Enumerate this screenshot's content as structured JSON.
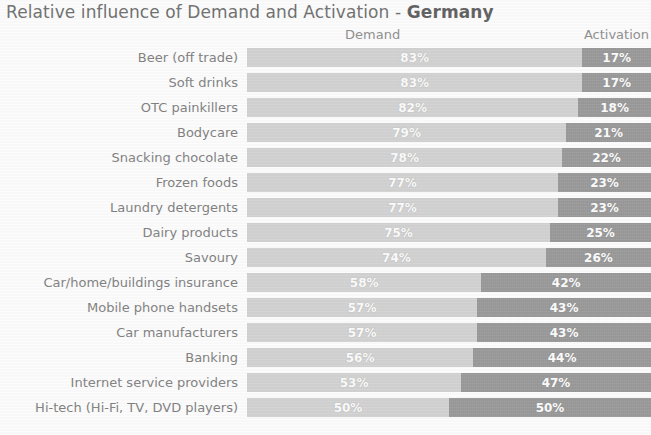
{
  "title": {
    "plain": "Relative influence of Demand and Activation - ",
    "bold": "Germany"
  },
  "headers": {
    "demand": "Demand",
    "activation": "Activation"
  },
  "colors": {
    "demand": "#d2d2d2",
    "activation": "#969696",
    "label_text": "#7b7b7b",
    "value_text": "#ffffff",
    "background": "#ffffff"
  },
  "chart_data": {
    "type": "bar",
    "title": "Relative influence of Demand and Activation - Germany",
    "xlabel": "",
    "ylabel": "",
    "xlim": [
      0,
      100
    ],
    "grid": false,
    "stacked": true,
    "orientation": "horizontal",
    "legend": [
      "Demand",
      "Activation"
    ],
    "legend_position": "top",
    "categories": [
      "Beer (off trade)",
      "Soft drinks",
      "OTC painkillers",
      "Bodycare",
      "Snacking chocolate",
      "Frozen foods",
      "Laundry detergents",
      "Dairy products",
      "Savoury",
      "Car/home/buildings insurance",
      "Mobile phone handsets",
      "Car manufacturers",
      "Banking",
      "Internet service providers",
      "Hi-tech (Hi-Fi, TV, DVD players)"
    ],
    "series": [
      {
        "name": "Demand",
        "values": [
          83,
          83,
          82,
          79,
          78,
          77,
          77,
          75,
          74,
          58,
          57,
          57,
          56,
          53,
          50
        ]
      },
      {
        "name": "Activation",
        "values": [
          17,
          17,
          18,
          21,
          22,
          23,
          23,
          25,
          26,
          42,
          43,
          43,
          44,
          47,
          50
        ]
      }
    ],
    "value_labels": {
      "demand": [
        "83%",
        "83%",
        "82%",
        "79%",
        "78%",
        "77%",
        "77%",
        "75%",
        "74%",
        "58%",
        "57%",
        "57%",
        "56%",
        "53%",
        "50%"
      ],
      "activation": [
        "17%",
        "17%",
        "18%",
        "21%",
        "22%",
        "23%",
        "23%",
        "25%",
        "26%",
        "42%",
        "43%",
        "43%",
        "44%",
        "47%",
        "50%"
      ]
    }
  }
}
